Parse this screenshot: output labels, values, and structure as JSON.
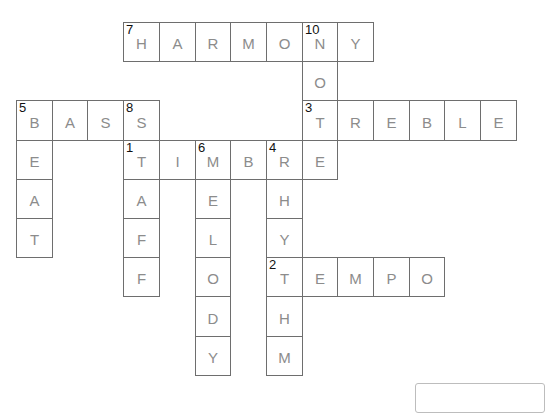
{
  "puzzle": {
    "grid": {
      "origin_x": 16,
      "origin_y": 22,
      "col_w": 35.7,
      "row_h": 39.2
    },
    "words": [
      {
        "number": 7,
        "direction": "across",
        "answer": "HARMONY",
        "row": 0,
        "col": 3
      },
      {
        "number": 10,
        "direction": "down",
        "answer": "NOTE",
        "row": 0,
        "col": 8
      },
      {
        "number": 5,
        "direction": "across",
        "answer": "BASS",
        "row": 2,
        "col": 0
      },
      {
        "number": 5,
        "direction": "down",
        "answer": "BEAT",
        "row": 2,
        "col": 0
      },
      {
        "number": 8,
        "direction": "down",
        "answer": "STAFF",
        "row": 2,
        "col": 3
      },
      {
        "number": 3,
        "direction": "across",
        "answer": "TREBLE",
        "row": 2,
        "col": 8
      },
      {
        "number": 1,
        "direction": "across",
        "answer": "TIMBRE",
        "row": 3,
        "col": 3
      },
      {
        "number": 6,
        "direction": "down",
        "answer": "MELODY",
        "row": 3,
        "col": 5
      },
      {
        "number": 4,
        "direction": "down",
        "answer": "RHYTHM",
        "row": 3,
        "col": 7
      },
      {
        "number": 2,
        "direction": "across",
        "answer": "TEMPO",
        "row": 6,
        "col": 7
      }
    ]
  },
  "answer_box": {
    "value": ""
  }
}
